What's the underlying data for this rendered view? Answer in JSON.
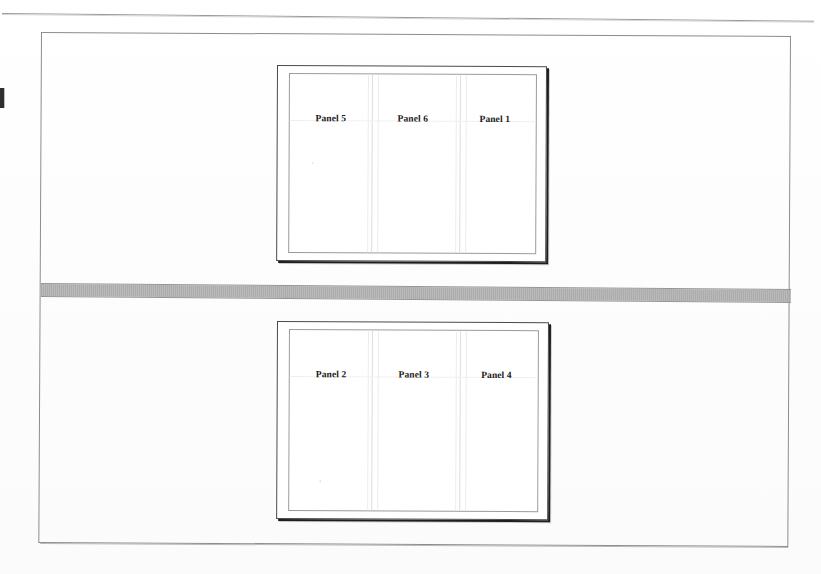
{
  "document": {
    "type": "scanned-page",
    "background_color": "#ffffff",
    "frame_border_color": "#8d8d8d",
    "divider_band_color": "#a8a8a8",
    "rule_color": "#9a9a9a"
  },
  "top_rule": {
    "name": "horizontal-rule"
  },
  "edge_artifact": {
    "name": "scan-edge-mark"
  },
  "divider_band": {
    "name": "gray-separator-band"
  },
  "figures": [
    {
      "id": "top-slide",
      "position": "top",
      "panels": [
        {
          "label": "Panel 5"
        },
        {
          "label": "Panel 6"
        },
        {
          "label": "Panel 1"
        }
      ]
    },
    {
      "id": "bottom-slide",
      "position": "bottom",
      "panels": [
        {
          "label": "Panel 2"
        },
        {
          "label": "Panel 3"
        },
        {
          "label": "Panel 4"
        }
      ]
    }
  ]
}
